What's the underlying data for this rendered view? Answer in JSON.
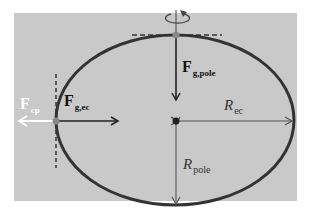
{
  "diagram": {
    "colors": {
      "background": "#ffffff",
      "panel": "#c9c9c9",
      "outline": "#333333",
      "arrow_dark": "#222222",
      "arrow_light": "#ffffff",
      "point": "#888888",
      "radius_line": "#555555"
    },
    "labels": {
      "f_cp": {
        "main": "F",
        "sub": "cp"
      },
      "f_g_ec": {
        "main": "F",
        "sub": "g,ec"
      },
      "f_g_pole": {
        "main": "F",
        "sub": "g,pole"
      },
      "r_ec": {
        "main": "R",
        "sub": "ec"
      },
      "r_pole": {
        "main": "R",
        "sub": "pole"
      }
    },
    "icons": {
      "rotation": "rotation-arrow-icon"
    }
  }
}
